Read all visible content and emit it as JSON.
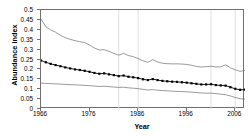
{
  "chart_data": {
    "type": "line",
    "title": "",
    "xlabel": "Year",
    "ylabel": "Abundance index",
    "xlim": [
      1966,
      2008
    ],
    "ylim": [
      0,
      0.5
    ],
    "grid": "vertical-light",
    "legend": "none",
    "xticks": [
      1966,
      1976,
      1986,
      1996,
      2006
    ],
    "xticklabels": [
      "1966",
      "1976",
      "1986",
      "1996",
      "2006"
    ],
    "yticks": [
      0,
      0.05,
      0.1,
      0.15,
      0.2,
      0.25,
      0.3,
      0.35,
      0.4,
      0.45,
      0.5
    ],
    "yticklabels": [
      "0",
      "0.05",
      "0.1",
      "0.15",
      "0.2",
      "0.25",
      "0.3",
      "0.35",
      "0.4",
      "0.45",
      "0.5"
    ],
    "gridlines_x": [
      1982,
      1986,
      2001,
      2006
    ],
    "x": [
      1966,
      1967,
      1968,
      1969,
      1970,
      1971,
      1972,
      1973,
      1974,
      1975,
      1976,
      1977,
      1978,
      1979,
      1980,
      1981,
      1982,
      1983,
      1984,
      1985,
      1986,
      1987,
      1988,
      1989,
      1990,
      1991,
      1992,
      1993,
      1994,
      1995,
      1996,
      1997,
      1998,
      1999,
      2000,
      2001,
      2002,
      2003,
      2004,
      2005,
      2006,
      2007,
      2008
    ],
    "series": [
      {
        "name": "Upper confidence limit",
        "style": "thin-line",
        "color": "#6f6f6f",
        "values": [
          0.455,
          0.415,
          0.399,
          0.388,
          0.372,
          0.36,
          0.352,
          0.345,
          0.34,
          0.336,
          0.323,
          0.308,
          0.298,
          0.3,
          0.291,
          0.281,
          0.272,
          0.281,
          0.27,
          0.264,
          0.255,
          0.243,
          0.236,
          0.249,
          0.238,
          0.231,
          0.229,
          0.228,
          0.228,
          0.227,
          0.225,
          0.221,
          0.215,
          0.212,
          0.214,
          0.216,
          0.212,
          0.213,
          0.223,
          0.208,
          0.198,
          0.19,
          0.196
        ]
      },
      {
        "name": "Abundance index",
        "style": "line-with-square-markers",
        "color": "#000000",
        "values": [
          0.245,
          0.236,
          0.228,
          0.222,
          0.216,
          0.21,
          0.205,
          0.2,
          0.197,
          0.193,
          0.188,
          0.182,
          0.178,
          0.18,
          0.175,
          0.171,
          0.166,
          0.169,
          0.163,
          0.16,
          0.156,
          0.15,
          0.146,
          0.151,
          0.146,
          0.142,
          0.14,
          0.138,
          0.137,
          0.135,
          0.133,
          0.13,
          0.127,
          0.124,
          0.124,
          0.125,
          0.121,
          0.119,
          0.118,
          0.11,
          0.102,
          0.097,
          0.098
        ]
      },
      {
        "name": "Lower confidence limit",
        "style": "thin-line",
        "color": "#6f6f6f",
        "values": [
          0.131,
          0.129,
          0.128,
          0.127,
          0.126,
          0.124,
          0.123,
          0.122,
          0.121,
          0.119,
          0.118,
          0.116,
          0.114,
          0.115,
          0.113,
          0.111,
          0.109,
          0.11,
          0.107,
          0.105,
          0.103,
          0.099,
          0.096,
          0.098,
          0.095,
          0.093,
          0.092,
          0.09,
          0.089,
          0.088,
          0.087,
          0.085,
          0.083,
          0.081,
          0.08,
          0.08,
          0.078,
          0.075,
          0.072,
          0.066,
          0.058,
          0.052,
          0.05
        ]
      }
    ]
  }
}
